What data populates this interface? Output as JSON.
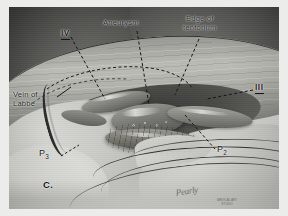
{
  "figure": {
    "panel_label": "C.",
    "kind": "surgical-anatomical-illustration",
    "palette": {
      "paper": "#ececea",
      "plate_background": "#cfcfcb",
      "ink": "#141412",
      "mid_tone": "#8a8a85",
      "deep_shadow": "#333331",
      "highlight": "#f8f8f6"
    }
  },
  "labels": {
    "aneurysm": "Aneurysm",
    "edge_of_tentorium": "Edge of\ntentorium",
    "vein_of_labbe": "Vein of\nLabbé",
    "nerve_iv": "IV",
    "nerve_iii": "III",
    "segment_p3_letter": "P",
    "segment_p3_sub": "3",
    "segment_p2_letter": "P",
    "segment_p2_sub": "2",
    "panel": "C."
  },
  "credit": {
    "signature": "Pearly",
    "stamp": "MEDICAL ART\nSTUDIO"
  }
}
